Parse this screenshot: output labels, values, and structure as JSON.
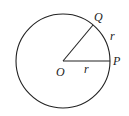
{
  "diagram": {
    "type": "circle-sector",
    "center": {
      "label": "O",
      "x": 63,
      "y": 61
    },
    "radius": 47,
    "points": [
      {
        "label": "P",
        "x": 110,
        "y": 61
      },
      {
        "label": "Q",
        "x": 93,
        "y": 25
      }
    ],
    "segment_labels": {
      "OP": "r",
      "arc_PQ": "r"
    },
    "stroke_color": "#222222"
  }
}
